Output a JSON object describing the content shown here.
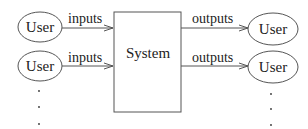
{
  "system": {
    "label": "System"
  },
  "inputs": [
    {
      "user": "User",
      "label": "inputs"
    },
    {
      "user": "User",
      "label": "inputs"
    }
  ],
  "outputs": [
    {
      "user": "User",
      "label": "outputs"
    },
    {
      "user": "User",
      "label": "outputs"
    }
  ],
  "ellipsis": "..."
}
